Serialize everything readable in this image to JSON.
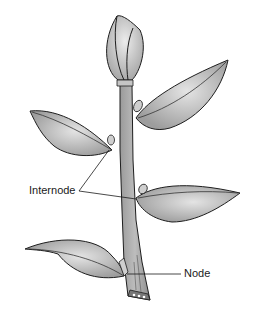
{
  "diagram": {
    "labels": {
      "internode": "Internode",
      "node": "Node"
    },
    "colors": {
      "outline": "#1e1e1e",
      "stem_fill": "#a8a8a8",
      "leaf_fill": "#b5b5b5",
      "leaf_highlight": "#e2e2e2",
      "bud_fill": "#cfcfcf",
      "background": "#ffffff"
    }
  }
}
